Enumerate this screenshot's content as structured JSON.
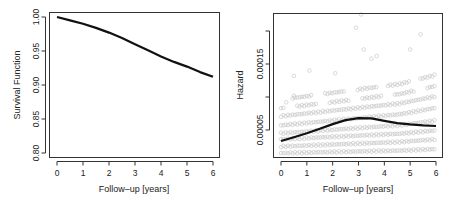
{
  "chart_data": [
    {
      "type": "line",
      "title": "",
      "xlabel": "Follow–up [years]",
      "ylabel": "Survival Function",
      "xlim": [
        0,
        6
      ],
      "ylim": [
        0.8,
        1.0
      ],
      "xticks": [
        0,
        1,
        2,
        3,
        4,
        5,
        6
      ],
      "yticks": [
        0.8,
        0.85,
        0.9,
        0.95,
        1.0
      ],
      "ytick_labels": [
        "0.80",
        "0.85",
        "0.90",
        "0.95",
        "1.00"
      ],
      "grid": false,
      "series": [
        {
          "name": "Survival",
          "x": [
            0,
            0.5,
            1,
            1.5,
            2,
            2.5,
            3,
            3.5,
            4,
            4.5,
            5,
            5.5,
            6
          ],
          "y": [
            1.0,
            0.995,
            0.99,
            0.984,
            0.977,
            0.969,
            0.96,
            0.951,
            0.942,
            0.934,
            0.927,
            0.919,
            0.912
          ]
        }
      ]
    },
    {
      "type": "scatter",
      "title": "",
      "xlabel": "Follow–up [years]",
      "ylabel": "Hazard",
      "xlim": [
        0,
        6
      ],
      "ylim": [
        1e-05,
        0.00022
      ],
      "xticks": [
        0,
        1,
        2,
        3,
        4,
        5,
        6
      ],
      "yticks": [
        5e-05,
        0.0001,
        0.00015,
        0.0002
      ],
      "ytick_labels": [
        "0.00005",
        "",
        "0.00015",
        ""
      ],
      "grid": false,
      "series": [
        {
          "name": "Hazard (smoothed)",
          "type": "line",
          "x": [
            0,
            0.5,
            1,
            1.5,
            2,
            2.5,
            3,
            3.5,
            4,
            4.5,
            5,
            5.5,
            6
          ],
          "y": [
            3.33e-05,
            3.9e-05,
            4.5e-05,
            5.2e-05,
            5.9e-05,
            6.5e-05,
            6.8e-05,
            6.75e-05,
            6.4e-05,
            6.05e-05,
            5.85e-05,
            5.7e-05,
            5.6e-05
          ]
        },
        {
          "name": "Individual hazards",
          "type": "scatter",
          "color": "#c9c9c9",
          "bands": [
            {
              "y0": 1.4e-05,
              "y1": 1.9e-05
            },
            {
              "y0": 2.4e-05,
              "y1": 3.3e-05
            },
            {
              "y0": 3.5e-05,
              "y1": 4.6e-05
            },
            {
              "y0": 4.4e-05,
              "y1": 6e-05
            },
            {
              "y0": 5.6e-05,
              "y1": 7.8e-05
            },
            {
              "y0": 7e-05,
              "y1": 9.5e-05
            },
            {
              "y0": 8.2e-05,
              "y1": 0.00011
            },
            {
              "y0": 9.5e-05,
              "y1": 0.000126
            }
          ],
          "outliers": [
            {
              "x": 0.5,
              "y": 0.000132
            },
            {
              "x": 1.1,
              "y": 0.00014
            },
            {
              "x": 2.1,
              "y": 0.000136
            },
            {
              "x": 2.9,
              "y": 0.000205
            },
            {
              "x": 3.1,
              "y": 0.000225
            },
            {
              "x": 3.2,
              "y": 0.000172
            },
            {
              "x": 3.5,
              "y": 0.000158
            },
            {
              "x": 3.7,
              "y": 0.000162
            },
            {
              "x": 5.0,
              "y": 0.000172
            },
            {
              "x": 5.4,
              "y": 0.000195
            },
            {
              "x": 0.2,
              "y": 9.2e-05
            },
            {
              "x": 0.5,
              "y": 0.000102
            }
          ]
        }
      ]
    }
  ]
}
